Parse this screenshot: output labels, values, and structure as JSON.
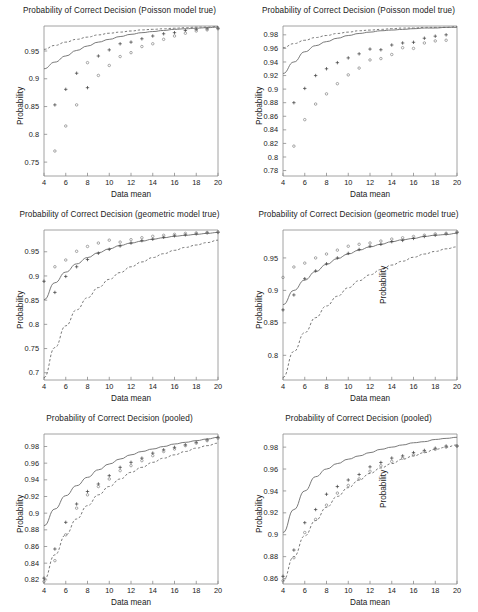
{
  "figure": {
    "layout": "3 rows x 2 columns of line+scatter plots",
    "background": "#ffffff",
    "line_color": "#555555",
    "text_color": "#222222"
  },
  "common": {
    "xlabel": "Data mean",
    "ylabel": "Probability",
    "xticks": [
      4,
      6,
      8,
      10,
      12,
      14,
      16,
      18,
      20
    ],
    "xlim": [
      4,
      20
    ]
  },
  "panels": [
    {
      "id": "panel-1",
      "title": "Probability of Correct Decision (Poisson model true)",
      "xlabel": "Data mean",
      "ylabel": "Probability",
      "yticks": [
        "0.75",
        "0.8",
        "0.85",
        "0.9",
        "0.95"
      ],
      "ylim": [
        0.725,
        0.995
      ],
      "stray_label": ""
    },
    {
      "id": "panel-2",
      "title": "Probability of Correct Decision (Poisson model true)",
      "xlabel": "Data mean",
      "ylabel": "Probability",
      "yticks": [
        "0.78",
        "0.8",
        "0.82",
        "0.84",
        "0.86",
        "0.88",
        "0.9",
        "0.92",
        "0.94",
        "0.96",
        "0.98"
      ],
      "ylim": [
        0.772,
        0.993
      ],
      "stray_label": ""
    },
    {
      "id": "panel-3",
      "title": "Probability of Correct Decision (geometric model true)",
      "xlabel": "Data mean",
      "ylabel": "Probability",
      "yticks": [
        "0.7",
        "0.75",
        "0.8",
        "0.85",
        "0.9",
        "0.95"
      ],
      "ylim": [
        0.685,
        0.995
      ],
      "stray_label": ""
    },
    {
      "id": "panel-4",
      "title": "Probability of Correct Decision (geometric model true)",
      "xlabel": "Data mean",
      "ylabel": "Probability",
      "yticks": [
        "0.8",
        "0.85",
        "0.9",
        "0.95"
      ],
      "ylim": [
        0.762,
        0.993
      ],
      "stray_label": "Probability"
    },
    {
      "id": "panel-5",
      "title": "Probability of Correct Decision (pooled)",
      "xlabel": "Data mean",
      "ylabel": "Probability",
      "yticks": [
        "0.82",
        "0.84",
        "0.86",
        "0.88",
        "0.9",
        "0.92",
        "0.94",
        "0.96",
        "0.98"
      ],
      "ylim": [
        0.815,
        0.995
      ],
      "stray_label": ""
    },
    {
      "id": "panel-6",
      "title": "Probability of Correct Decision (pooled)",
      "xlabel": "Data mean",
      "ylabel": "Probability",
      "yticks": [
        "0.86",
        "0.88",
        "0.9",
        "0.92",
        "0.94",
        "0.96",
        "0.98"
      ],
      "ylim": [
        0.855,
        0.992
      ],
      "stray_label": "Probability"
    }
  ],
  "chart_data": [
    {
      "type": "line",
      "id": "panel-1",
      "title": "Probability of Correct Decision (Poisson model true)",
      "xlabel": "Data mean",
      "ylabel": "Probability",
      "xlim": [
        4,
        20
      ],
      "ylim": [
        0.725,
        0.995
      ],
      "xticks": [
        4,
        6,
        8,
        10,
        12,
        14,
        16,
        18,
        20
      ],
      "yticks": [
        0.75,
        0.8,
        0.85,
        0.9,
        0.95
      ],
      "grid": false,
      "legend": "none",
      "x": [
        4,
        5,
        6,
        7,
        8,
        9,
        10,
        11,
        12,
        13,
        14,
        15,
        16,
        17,
        18,
        19,
        20
      ],
      "series": [
        {
          "name": "solid-curve",
          "style": "solid",
          "values": [
            0.918,
            0.93,
            0.941,
            0.951,
            0.959,
            0.966,
            0.971,
            0.976,
            0.98,
            0.983,
            0.985,
            0.987,
            0.989,
            0.99,
            0.991,
            0.992,
            0.993
          ]
        },
        {
          "name": "dashed-curve",
          "style": "dashed",
          "values": [
            0.953,
            0.96,
            0.966,
            0.971,
            0.975,
            0.979,
            0.982,
            0.984,
            0.986,
            0.988,
            0.989,
            0.99,
            0.991,
            0.992,
            0.993,
            0.993,
            0.994
          ]
        },
        {
          "name": "plus-markers",
          "style": "scatter-plus",
          "values": [
            null,
            0.853,
            0.881,
            0.91,
            0.884,
            0.941,
            0.952,
            0.963,
            0.966,
            0.972,
            0.977,
            0.981,
            0.983,
            0.987,
            0.989,
            0.99,
            0.991
          ]
        },
        {
          "name": "circle-markers",
          "style": "scatter-circle",
          "values": [
            null,
            0.77,
            0.815,
            0.853,
            0.929,
            0.906,
            0.924,
            0.94,
            0.947,
            0.958,
            0.963,
            0.971,
            0.977,
            0.982,
            0.986,
            0.988,
            0.99
          ]
        }
      ]
    },
    {
      "type": "line",
      "id": "panel-2",
      "title": "Probability of Correct Decision (Poisson model true)",
      "xlabel": "Data mean",
      "ylabel": "Probability",
      "xlim": [
        4,
        20
      ],
      "ylim": [
        0.772,
        0.993
      ],
      "xticks": [
        4,
        6,
        8,
        10,
        12,
        14,
        16,
        18,
        20
      ],
      "yticks": [
        0.78,
        0.8,
        0.82,
        0.84,
        0.86,
        0.88,
        0.9,
        0.92,
        0.94,
        0.96,
        0.98
      ],
      "grid": false,
      "legend": "none",
      "x": [
        4,
        5,
        6,
        7,
        8,
        9,
        10,
        11,
        12,
        13,
        14,
        15,
        16,
        17,
        18,
        19,
        20
      ],
      "series": [
        {
          "name": "solid-curve",
          "style": "solid",
          "values": [
            0.923,
            0.94,
            0.955,
            0.964,
            0.97,
            0.975,
            0.979,
            0.982,
            0.984,
            0.986,
            0.987,
            0.988,
            0.989,
            0.99,
            0.99,
            0.991,
            0.991
          ]
        },
        {
          "name": "dashed-curve",
          "style": "dashed",
          "values": [
            0.961,
            0.967,
            0.972,
            0.976,
            0.979,
            0.982,
            0.984,
            0.986,
            0.987,
            0.988,
            0.989,
            0.99,
            0.99,
            0.991,
            0.991,
            0.991,
            0.992
          ]
        },
        {
          "name": "plus-markers",
          "style": "scatter-plus",
          "values": [
            null,
            0.88,
            0.901,
            0.92,
            0.93,
            0.939,
            0.946,
            0.952,
            0.959,
            0.958,
            0.965,
            0.968,
            0.969,
            0.975,
            0.978,
            0.98,
            null
          ]
        },
        {
          "name": "circle-markers",
          "style": "scatter-circle",
          "values": [
            null,
            0.816,
            0.855,
            0.878,
            0.893,
            0.908,
            0.921,
            0.931,
            0.943,
            0.945,
            0.951,
            0.961,
            0.96,
            0.968,
            0.971,
            0.972,
            null
          ]
        }
      ]
    },
    {
      "type": "line",
      "id": "panel-3",
      "title": "Probability of Correct Decision (geometric model true)",
      "xlabel": "Data mean",
      "ylabel": "Probability",
      "xlim": [
        4,
        20
      ],
      "ylim": [
        0.685,
        0.995
      ],
      "xticks": [
        4,
        6,
        8,
        10,
        12,
        14,
        16,
        18,
        20
      ],
      "yticks": [
        0.7,
        0.75,
        0.8,
        0.85,
        0.9,
        0.95
      ],
      "grid": false,
      "legend": "none",
      "x": [
        4,
        5,
        6,
        7,
        8,
        9,
        10,
        11,
        12,
        13,
        14,
        15,
        16,
        17,
        18,
        19,
        20
      ],
      "series": [
        {
          "name": "solid-curve",
          "style": "solid",
          "values": [
            0.851,
            0.886,
            0.908,
            0.925,
            0.938,
            0.948,
            0.956,
            0.963,
            0.968,
            0.972,
            0.976,
            0.979,
            0.982,
            0.984,
            0.986,
            0.988,
            0.99
          ]
        },
        {
          "name": "dashed-curve",
          "style": "dashed",
          "values": [
            0.69,
            0.752,
            0.797,
            0.83,
            0.855,
            0.876,
            0.893,
            0.907,
            0.919,
            0.929,
            0.938,
            0.946,
            0.953,
            0.959,
            0.964,
            0.969,
            0.974
          ]
        },
        {
          "name": "plus-markers",
          "style": "scatter-plus",
          "values": [
            0.889,
            0.866,
            0.899,
            0.919,
            0.934,
            0.947,
            0.955,
            0.962,
            0.968,
            0.973,
            0.976,
            0.98,
            0.983,
            0.985,
            0.987,
            0.989,
            0.99
          ]
        },
        {
          "name": "circle-markers",
          "style": "scatter-circle",
          "values": [
            null,
            0.919,
            0.933,
            0.951,
            0.961,
            0.968,
            0.974,
            0.97,
            0.975,
            0.979,
            0.982,
            0.984,
            0.986,
            0.988,
            0.989,
            0.99,
            0.991
          ]
        }
      ]
    },
    {
      "type": "line",
      "id": "panel-4",
      "title": "Probability of Correct Decision (geometric model true)",
      "xlabel": "Data mean",
      "ylabel": "Probability",
      "xlim": [
        4,
        20
      ],
      "ylim": [
        0.762,
        0.993
      ],
      "xticks": [
        4,
        6,
        8,
        10,
        12,
        14,
        16,
        18,
        20
      ],
      "yticks": [
        0.8,
        0.85,
        0.9,
        0.95
      ],
      "grid": false,
      "legend": "none",
      "x": [
        4,
        5,
        6,
        7,
        8,
        9,
        10,
        11,
        12,
        13,
        14,
        15,
        16,
        17,
        18,
        19,
        20
      ],
      "series": [
        {
          "name": "solid-curve",
          "style": "solid",
          "values": [
            0.878,
            0.9,
            0.916,
            0.929,
            0.94,
            0.949,
            0.956,
            0.962,
            0.967,
            0.971,
            0.975,
            0.978,
            0.98,
            0.983,
            0.985,
            0.986,
            0.988
          ]
        },
        {
          "name": "dashed-curve",
          "style": "dashed",
          "values": [
            0.766,
            0.806,
            0.835,
            0.858,
            0.876,
            0.891,
            0.904,
            0.915,
            0.924,
            0.932,
            0.939,
            0.945,
            0.951,
            0.956,
            0.96,
            0.964,
            0.967
          ]
        },
        {
          "name": "plus-markers",
          "style": "scatter-plus",
          "values": [
            0.87,
            0.893,
            0.918,
            0.93,
            0.941,
            0.95,
            0.957,
            0.963,
            0.968,
            0.971,
            0.975,
            0.977,
            0.98,
            0.983,
            0.985,
            0.987,
            0.989
          ]
        },
        {
          "name": "circle-markers",
          "style": "scatter-circle",
          "values": [
            0.92,
            0.936,
            0.942,
            0.95,
            0.956,
            0.962,
            0.968,
            0.971,
            0.973,
            0.976,
            0.979,
            0.981,
            0.983,
            0.985,
            0.987,
            0.988,
            0.99
          ]
        }
      ]
    },
    {
      "type": "line",
      "id": "panel-5",
      "title": "Probability of Correct Decision (pooled)",
      "xlabel": "Data mean",
      "ylabel": "Probability",
      "xlim": [
        4,
        20
      ],
      "ylim": [
        0.815,
        0.995
      ],
      "xticks": [
        4,
        6,
        8,
        10,
        12,
        14,
        16,
        18,
        20
      ],
      "yticks": [
        0.82,
        0.84,
        0.86,
        0.88,
        0.9,
        0.92,
        0.94,
        0.96,
        0.98
      ],
      "grid": false,
      "legend": "none",
      "x": [
        4,
        5,
        6,
        7,
        8,
        9,
        10,
        11,
        12,
        13,
        14,
        15,
        16,
        17,
        18,
        19,
        20
      ],
      "series": [
        {
          "name": "solid-curve",
          "style": "solid",
          "values": [
            0.885,
            0.905,
            0.921,
            0.933,
            0.943,
            0.952,
            0.959,
            0.965,
            0.97,
            0.974,
            0.977,
            0.98,
            0.983,
            0.985,
            0.987,
            0.989,
            0.991
          ]
        },
        {
          "name": "dashed-curve",
          "style": "dashed",
          "values": [
            0.82,
            0.85,
            0.874,
            0.893,
            0.909,
            0.922,
            0.932,
            0.941,
            0.949,
            0.955,
            0.961,
            0.966,
            0.97,
            0.974,
            0.978,
            0.981,
            0.984
          ]
        },
        {
          "name": "plus-markers",
          "style": "scatter-plus",
          "values": [
            0.822,
            0.857,
            0.889,
            0.911,
            0.926,
            0.935,
            0.945,
            0.955,
            0.961,
            0.966,
            0.972,
            0.976,
            0.979,
            0.982,
            0.985,
            0.988,
            0.991
          ]
        },
        {
          "name": "circle-markers",
          "style": "scatter-circle",
          "values": [
            0.818,
            0.843,
            0.874,
            0.906,
            0.922,
            0.932,
            0.941,
            0.951,
            0.957,
            0.963,
            0.969,
            0.974,
            0.977,
            0.981,
            0.984,
            0.987,
            0.99
          ]
        }
      ]
    },
    {
      "type": "line",
      "id": "panel-6",
      "title": "Probability of Correct Decision (pooled)",
      "xlabel": "Data mean",
      "ylabel": "Probability",
      "xlim": [
        4,
        20
      ],
      "ylim": [
        0.855,
        0.992
      ],
      "xticks": [
        4,
        6,
        8,
        10,
        12,
        14,
        16,
        18,
        20
      ],
      "yticks": [
        0.86,
        0.88,
        0.9,
        0.92,
        0.94,
        0.96,
        0.98
      ],
      "grid": false,
      "legend": "none",
      "x": [
        4,
        5,
        6,
        7,
        8,
        9,
        10,
        11,
        12,
        13,
        14,
        15,
        16,
        17,
        18,
        19,
        20
      ],
      "series": [
        {
          "name": "solid-curve",
          "style": "solid",
          "values": [
            0.902,
            0.923,
            0.94,
            0.953,
            0.96,
            0.965,
            0.969,
            0.972,
            0.975,
            0.978,
            0.98,
            0.982,
            0.984,
            0.985,
            0.987,
            0.988,
            0.989
          ]
        },
        {
          "name": "dashed-curve",
          "style": "dashed",
          "values": [
            0.858,
            0.88,
            0.899,
            0.913,
            0.925,
            0.935,
            0.943,
            0.95,
            0.956,
            0.961,
            0.965,
            0.969,
            0.972,
            0.975,
            0.978,
            0.98,
            0.982
          ]
        },
        {
          "name": "plus-markers",
          "style": "scatter-plus",
          "values": [
            0.862,
            0.886,
            0.911,
            0.923,
            0.937,
            0.944,
            0.95,
            0.955,
            0.962,
            0.966,
            0.97,
            0.972,
            0.975,
            0.977,
            0.979,
            0.981,
            0.981
          ]
        },
        {
          "name": "circle-markers",
          "style": "scatter-circle",
          "values": [
            0.858,
            0.879,
            0.902,
            0.914,
            0.927,
            0.938,
            0.945,
            0.951,
            0.958,
            0.963,
            0.967,
            0.97,
            0.973,
            0.976,
            0.978,
            0.98,
            0.981
          ]
        }
      ]
    }
  ]
}
